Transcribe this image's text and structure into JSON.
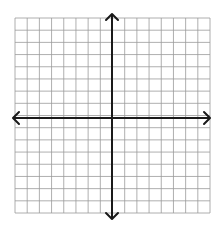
{
  "diagram": {
    "type": "coordinate-plane",
    "grid": {
      "columns": 16,
      "rows": 16,
      "left": 15,
      "top": 18,
      "right": 210,
      "bottom": 213,
      "line_color": "#9a9a9a",
      "background": "#ffffff"
    },
    "axes": {
      "x_axis": {
        "y": 118,
        "x_start": 13,
        "x_end": 210,
        "arrows": "both"
      },
      "y_axis": {
        "x": 112,
        "y_start": 14,
        "y_end": 219,
        "arrows": "both"
      },
      "color": "#1a1a1a"
    }
  }
}
